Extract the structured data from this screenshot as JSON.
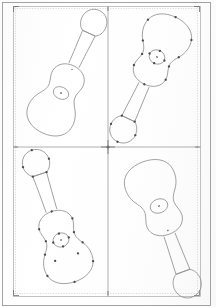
{
  "document": {
    "title": "Guitar Outline Layout Sheet",
    "sheet_width": 216,
    "sheet_height": 307,
    "background_color": "#fefefe",
    "line_color": "#8e8e8e",
    "frame_color": "#9a9a9a",
    "anchor_color": "#4a4a4a",
    "description": "Scanned vector layout sheet with four acoustic guitar outline drawings arranged in a two-by-two grid, separated by crop/divider rules with a central registration crosshair."
  },
  "frame": {
    "outer": {
      "x": 2,
      "y": 2,
      "width": 208,
      "height": 303
    },
    "inner": {
      "x": 13,
      "y": 6,
      "width": 187,
      "height": 290
    },
    "vertical_divider_x": 108,
    "horizontal_divider_y": 147,
    "registration_mark": {
      "x": 108,
      "y": 147,
      "arm_length": 7
    }
  },
  "panels": [
    {
      "id": "panel-top-left",
      "label": "Top Left Panel",
      "cell": {
        "row": 1,
        "col": 1
      },
      "bounds": {
        "x": 13,
        "y": 6,
        "width": 95,
        "height": 141
      },
      "drawing": {
        "name": "acoustic-guitar-outline",
        "orientation": "headstock-upper-right",
        "rotation_degrees": 25,
        "anchors_visible": false,
        "sound_hole_center": {
          "x": 61,
          "y": 93
        },
        "sound_hole_radius_x": 8,
        "sound_hole_radius_y": 6
      }
    },
    {
      "id": "panel-top-right",
      "label": "Top Right Panel",
      "cell": {
        "row": 1,
        "col": 2
      },
      "bounds": {
        "x": 108,
        "y": 6,
        "width": 92,
        "height": 141
      },
      "drawing": {
        "name": "acoustic-guitar-outline",
        "orientation": "body-upper-left-neck-lower-right",
        "rotation_degrees": 205,
        "anchors_visible": true,
        "anchor_count": 18,
        "sound_hole_center": {
          "x": 157,
          "y": 57
        },
        "sound_hole_radius_x": 8,
        "sound_hole_radius_y": 7
      }
    },
    {
      "id": "panel-bottom-left",
      "label": "Bottom Left Panel",
      "cell": {
        "row": 2,
        "col": 1
      },
      "bounds": {
        "x": 13,
        "y": 147,
        "width": 95,
        "height": 149
      },
      "drawing": {
        "name": "acoustic-guitar-outline",
        "orientation": "headstock-upper-left",
        "rotation_degrees": -18,
        "anchors_visible": true,
        "anchor_count": 20,
        "sound_hole_center": {
          "x": 61,
          "y": 240
        },
        "sound_hole_radius_x": 8,
        "sound_hole_radius_y": 7
      }
    },
    {
      "id": "panel-bottom-right",
      "label": "Bottom Right Panel",
      "cell": {
        "row": 2,
        "col": 2
      },
      "bounds": {
        "x": 108,
        "y": 147,
        "width": 92,
        "height": 149
      },
      "drawing": {
        "name": "acoustic-guitar-outline",
        "orientation": "body-upper-right-neck-lower-left",
        "rotation_degrees": 160,
        "anchors_visible": false,
        "sound_hole_center": {
          "x": 159,
          "y": 206
        },
        "sound_hole_radius_x": 9,
        "sound_hole_radius_y": 7
      }
    }
  ]
}
